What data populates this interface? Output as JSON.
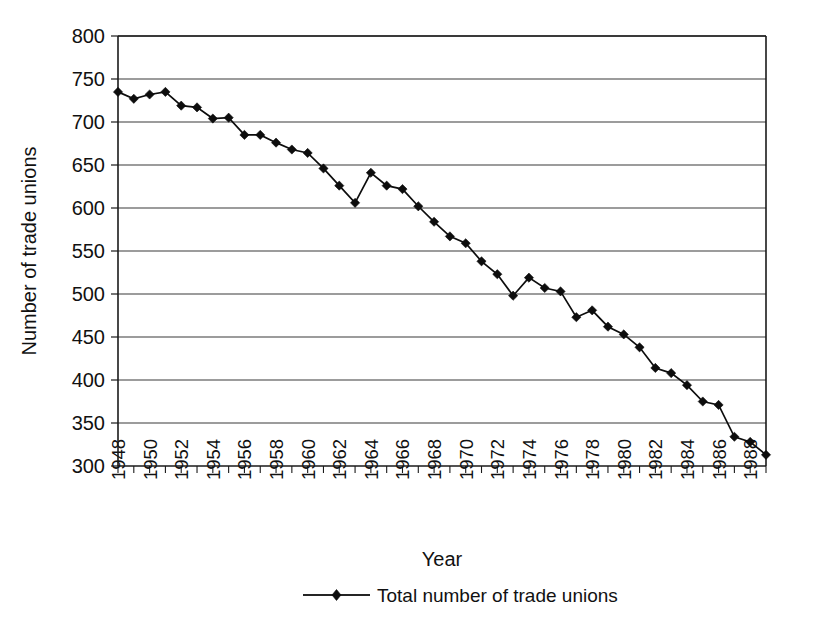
{
  "chart_data": {
    "type": "line",
    "title": "",
    "xlabel": "Year",
    "ylabel": "Number of trade unions",
    "xlim": [
      1948,
      1989
    ],
    "ylim": [
      300,
      800
    ],
    "ytick_step": 50,
    "xtick_label_step": 2,
    "grid": true,
    "legend_position": "bottom",
    "marker": "diamond",
    "line_color": "#0d0d0d",
    "grid_color": "#3a3a3a",
    "axis_color": "#1a1a1a",
    "y_ticks": [
      300,
      350,
      400,
      450,
      500,
      550,
      600,
      650,
      700,
      750,
      800
    ],
    "x_tick_labels": [
      "1948",
      "1950",
      "1952",
      "1954",
      "1956",
      "1958",
      "1960",
      "1962",
      "1964",
      "1966",
      "1968",
      "1970",
      "1972",
      "1974",
      "1976",
      "1978",
      "1980",
      "1982",
      "1984",
      "1986",
      "1988"
    ],
    "series": [
      {
        "name": "Total number of trade unions",
        "x": [
          1948,
          1949,
          1950,
          1951,
          1952,
          1953,
          1954,
          1955,
          1956,
          1957,
          1958,
          1959,
          1960,
          1961,
          1962,
          1963,
          1964,
          1965,
          1966,
          1967,
          1968,
          1969,
          1970,
          1971,
          1972,
          1973,
          1974,
          1975,
          1976,
          1977,
          1978,
          1979,
          1980,
          1981,
          1982,
          1983,
          1984,
          1985,
          1986,
          1987,
          1988,
          1989
        ],
        "values": [
          735,
          727,
          732,
          735,
          719,
          717,
          704,
          705,
          685,
          685,
          676,
          668,
          664,
          646,
          626,
          606,
          641,
          626,
          622,
          602,
          584,
          567,
          559,
          538,
          523,
          498,
          519,
          507,
          503,
          473,
          481,
          462,
          453,
          438,
          414,
          408,
          394,
          375,
          371,
          334,
          328,
          313
        ]
      }
    ],
    "legend": [
      {
        "label": "Total number of trade unions",
        "marker": "diamond",
        "color": "#0d0d0d"
      }
    ]
  },
  "layout": {
    "plot_left": 118,
    "plot_right": 766,
    "plot_top": 36,
    "plot_bottom": 466
  }
}
